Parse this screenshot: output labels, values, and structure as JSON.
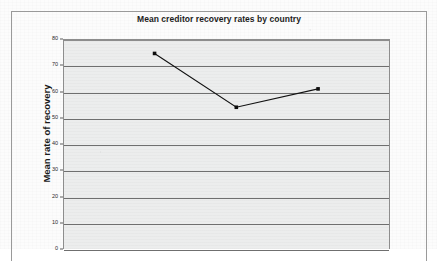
{
  "chart_data": {
    "type": "line",
    "title": "Mean creditor recovery rates by country",
    "xlabel": "",
    "ylabel": "Mean rate of recovery",
    "ylim": [
      0,
      80
    ],
    "ytick_values": [
      80,
      70,
      60,
      50,
      40,
      30,
      20,
      10,
      0
    ],
    "ytick_labels": [
      "80",
      "70",
      "60",
      "50",
      "40",
      "30",
      "20",
      "10",
      "0"
    ],
    "grid": true,
    "legend": "none",
    "categories": [
      "",
      "",
      ""
    ],
    "x": [
      1,
      2,
      3
    ],
    "values": [
      74.5,
      54,
      61
    ],
    "series": [
      {
        "name": "Mean rate of recovery",
        "values": [
          74.5,
          54,
          61
        ]
      }
    ],
    "note": "Chart is vertically cropped at the bottom of the screenshot; x-axis category labels are not visible."
  },
  "page": {
    "title": "Mean creditor recovery rates by country",
    "y_axis_caption": "Mean rate of recovery"
  }
}
